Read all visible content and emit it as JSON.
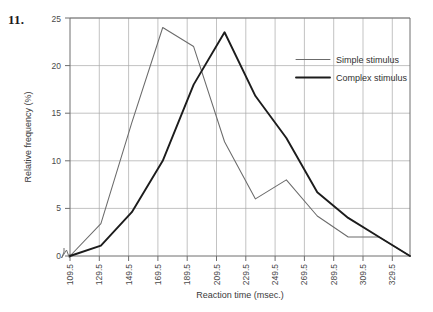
{
  "figure": {
    "problem_number": "11."
  },
  "chart_data": {
    "type": "line",
    "title": "",
    "xlabel": "Reaction time (msec.)",
    "ylabel": "Relative frequency (%)",
    "categories": [
      "109.5",
      "129.5",
      "149.5",
      "169.5",
      "189.5",
      "209.5",
      "229.5",
      "249.5",
      "269.5",
      "289.5",
      "309.5",
      "329.5"
    ],
    "x": [
      109.5,
      129.5,
      149.5,
      169.5,
      189.5,
      209.5,
      229.5,
      249.5,
      269.5,
      289.5,
      309.5,
      329.5
    ],
    "xlim": [
      109.5,
      329.5
    ],
    "ylim": [
      0,
      25
    ],
    "yticks": [
      0,
      5,
      10,
      15,
      20,
      25
    ],
    "grid": true,
    "legend_position": "top-right",
    "axis_break": true,
    "series": [
      {
        "name": "Simple stimulus",
        "color": "#6b6b6b",
        "line_width": "thin",
        "values": [
          0,
          3.4,
          14.0,
          24.0,
          22.0,
          12.0,
          6.0,
          8.0,
          4.2,
          2.0,
          2.0,
          0
        ]
      },
      {
        "name": "Complex stimulus",
        "color": "#1c1c1c",
        "line_width": "thick",
        "values": [
          0,
          1.1,
          4.6,
          10.0,
          18.0,
          23.5,
          16.8,
          12.4,
          6.7,
          4.0,
          2.0,
          0
        ]
      }
    ]
  },
  "legend": {
    "items": [
      {
        "label": "Simple stimulus"
      },
      {
        "label": "Complex stimulus"
      }
    ]
  },
  "axes": {
    "y_tick_labels": [
      "0",
      "5",
      "10",
      "15",
      "20",
      "25"
    ],
    "x_tick_labels": [
      "109.5",
      "129.5",
      "149.5",
      "169.5",
      "189.5",
      "209.5",
      "229.5",
      "249.5",
      "269.5",
      "289.5",
      "309.5",
      "329.5"
    ],
    "y_title": "Relative frequency (%)",
    "x_title": "Reaction time (msec.)"
  }
}
